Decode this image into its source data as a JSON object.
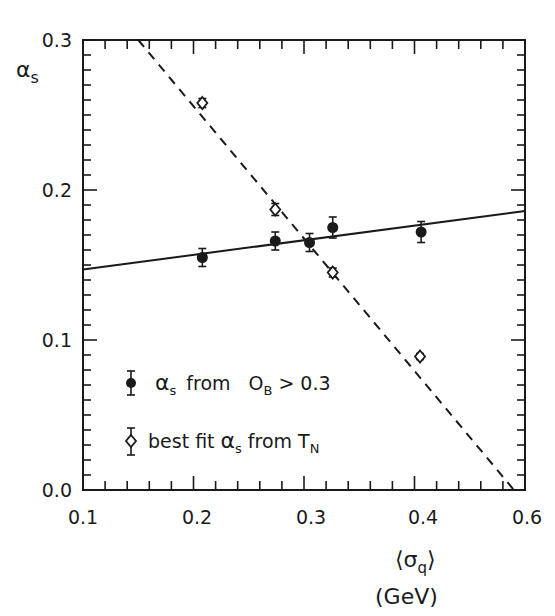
{
  "chart_data": {
    "type": "scatter",
    "title": "",
    "xlabel": "⟨σq⟩ (GeV)",
    "ylabel": "αs",
    "x_tick_labels": [
      "0.1",
      "0.2",
      "0.3",
      "0.4",
      "0.6"
    ],
    "y_tick_labels": [
      "0.0",
      "0.1",
      "0.2",
      "0.3"
    ],
    "xlim": [
      0.1,
      0.5
    ],
    "ylim": [
      0.0,
      0.3
    ],
    "grid": false,
    "legend_position": "lower-left inside",
    "series": [
      {
        "name": "αs from OB > 0.3",
        "marker": "filled-circle",
        "error_bars": true,
        "x": [
          0.208,
          0.274,
          0.305,
          0.326,
          0.406
        ],
        "y": [
          0.155,
          0.166,
          0.165,
          0.175,
          0.172
        ],
        "yerr": [
          0.006,
          0.006,
          0.006,
          0.007,
          0.007
        ]
      },
      {
        "name": "best fit αs from TN",
        "marker": "open-diamond",
        "error_bars": true,
        "x": [
          0.208,
          0.274,
          0.326,
          0.405
        ],
        "y": [
          0.258,
          0.187,
          0.145,
          0.089
        ],
        "yerr": [
          0.003,
          0.004,
          0.003,
          0.002
        ]
      }
    ],
    "fit_lines": [
      {
        "name": "solid fit (OB > 0.3)",
        "style": "solid",
        "x": [
          0.1,
          0.5
        ],
        "y": [
          0.147,
          0.186
        ]
      },
      {
        "name": "dashed fit (TN)",
        "style": "dashed",
        "x": [
          0.15,
          0.49
        ],
        "y": [
          0.3,
          0.0
        ]
      }
    ]
  },
  "labels": {
    "y_axis_symbol": "α",
    "y_axis_sub": "s",
    "x_axis_line1_open": "⟨",
    "x_axis_line1_sigma": "σ",
    "x_axis_line1_sub": "q",
    "x_axis_line1_close": "⟩",
    "x_axis_line2": "(GeV)"
  },
  "legend": {
    "item1_alpha": "α",
    "item1_sub": "s",
    "item1_rest": "from",
    "item1_O": "O",
    "item1_Osub": "B",
    "item1_tail": "> 0.3",
    "item2_pre": "best fit",
    "item2_alpha": "α",
    "item2_sub": "s",
    "item2_from": "from",
    "item2_T": "T",
    "item2_Tsub": "N"
  }
}
